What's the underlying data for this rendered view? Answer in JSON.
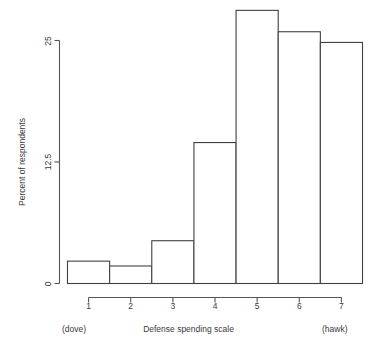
{
  "chart_data": {
    "type": "bar",
    "title": "",
    "subtitle": "",
    "xlabel": "Defense spending scale",
    "ylabel": "Percent of respondents",
    "categories": [
      "1",
      "2",
      "3",
      "4",
      "5",
      "6",
      "7"
    ],
    "values": [
      2.3,
      1.8,
      4.4,
      14.5,
      28.1,
      25.9,
      24.8
    ],
    "xlim": [
      0.5,
      7.5
    ],
    "ylim": [
      0,
      28.1
    ],
    "x_ticks": [
      "1",
      "2",
      "3",
      "4",
      "5",
      "6",
      "7"
    ],
    "y_ticks": [
      "0",
      "12.5",
      "25"
    ],
    "y_tick_values": [
      0,
      12.5,
      25
    ],
    "grid": false,
    "legend": false,
    "legend_position": "none",
    "annotations": [
      {
        "text": "(dove)",
        "position": "below-left-axis"
      },
      {
        "text": "(hawk)",
        "position": "below-right-axis"
      }
    ],
    "colors": {
      "bar_fill": "#ffffff",
      "bar_stroke": "#404040",
      "axis": "#555555",
      "text": "#3a3a3a",
      "background": "#ffffff"
    }
  },
  "labels": {
    "dove": "(dove)",
    "hawk": "(hawk)",
    "x_axis_title": "Defense spending scale",
    "y_axis_title": "Percent of respondents"
  }
}
